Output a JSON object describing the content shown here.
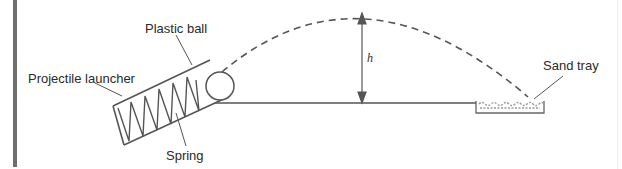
{
  "diagram": {
    "labels": {
      "plastic_ball": "Plastic ball",
      "projectile_launcher": "Projectile launcher",
      "spring": "Spring",
      "sand_tray": "Sand tray",
      "height": "h"
    },
    "colors": {
      "line": "#555555",
      "text": "#2a2a2a",
      "border": "#6e6e6e",
      "sand": "#9a9a9a"
    }
  }
}
